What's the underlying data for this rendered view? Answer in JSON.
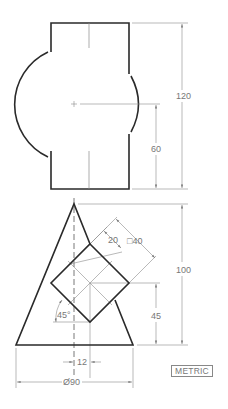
{
  "drawing": {
    "top_view": {
      "dimensions": {
        "overall_height": "120",
        "center_height": "60"
      }
    },
    "front_view": {
      "dimensions": {
        "overall_height": "100",
        "square_size": "□40",
        "square_offset": "20",
        "square_center_height": "45",
        "rotation_angle": "45°",
        "center_offset": "12",
        "base_diameter": "Ø90"
      }
    },
    "units_label": "METRIC",
    "colors": {
      "object_line": "#2a2a2a",
      "dimension_line": "#8a8a8a",
      "dimension_text": "#777777"
    }
  }
}
